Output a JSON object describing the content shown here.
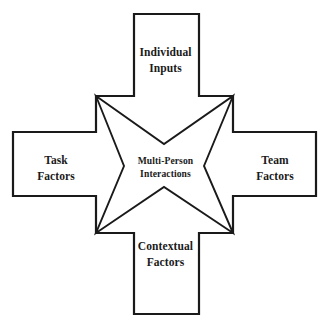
{
  "diagram": {
    "type": "cross-with-four-point-star",
    "background_color": "#ffffff",
    "stroke_color": "#1a1a1a",
    "text_color": "#1a1a1a",
    "labels": {
      "top": {
        "name": "individual-inputs",
        "line1": "Individual",
        "line2": "Inputs"
      },
      "left": {
        "name": "task-factors",
        "line1": "Task",
        "line2": "Factors"
      },
      "right": {
        "name": "team-factors",
        "line1": "Team",
        "line2": "Factors"
      },
      "bottom": {
        "name": "contextual-factors",
        "line1": "Contextual",
        "line2": "Factors"
      },
      "center": {
        "name": "multi-person-interactions",
        "line1": "Multi-Person",
        "line2": "Interactions"
      }
    },
    "geometry": {
      "cross_points": "134,14 199,14 199,96 233,96 233,132 316,132 316,196 233,196 233,233 199,233 199,314 134,314 134,233 96,233 96,196 13,196 13,132 96,132 96,96 134,96",
      "star_points": "96,96 164,144 233,96 204,166 233,233 164,187 96,233 124,166",
      "cross_stroke_width": 2.2,
      "star_stroke_width": 1.9
    }
  }
}
